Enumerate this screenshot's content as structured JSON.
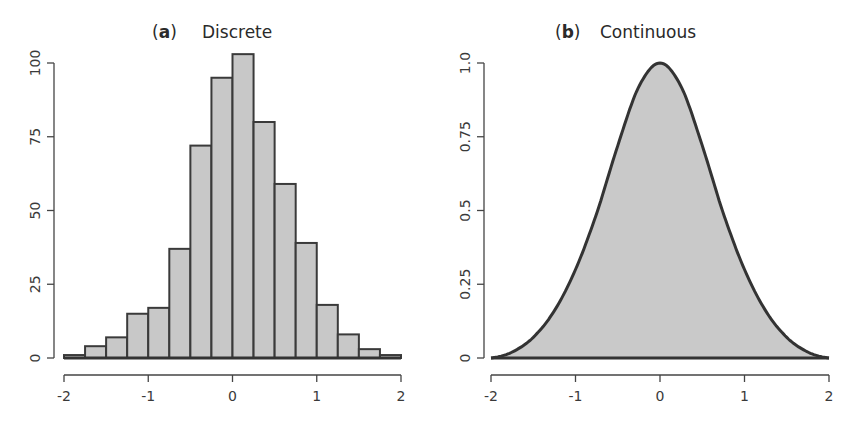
{
  "chart_data": [
    {
      "type": "bar",
      "panel_label": "a",
      "title": "Discrete",
      "xlabel": "",
      "ylabel": "",
      "bin_edges": [
        -2,
        -1.75,
        -1.5,
        -1.25,
        -1,
        -0.75,
        -0.5,
        -0.25,
        0,
        0.25,
        0.5,
        0.75,
        1,
        1.25,
        1.5,
        1.75,
        2
      ],
      "values": [
        1,
        4,
        7,
        15,
        17,
        37,
        72,
        95,
        103,
        80,
        59,
        39,
        18,
        8,
        3,
        1
      ],
      "xlim": [
        -2,
        2
      ],
      "ylim": [
        0,
        100
      ],
      "xticks": [
        -2,
        -1,
        0,
        1,
        2
      ],
      "xtick_labels": [
        "-2",
        "-1",
        "0",
        "1",
        "2"
      ],
      "yticks": [
        0,
        25,
        50,
        75,
        100
      ],
      "ytick_labels": [
        "0",
        "25",
        "50",
        "75",
        "100"
      ],
      "grid": false,
      "fill_color": "#c8c8c8",
      "edge_color": "#3a3a3a"
    },
    {
      "type": "area",
      "panel_label": "b",
      "title": "Continuous",
      "xlabel": "",
      "ylabel": "",
      "function": "normalized density, peak 1.0 at x=0",
      "x": [
        -2,
        -1.75,
        -1.5,
        -1.25,
        -1,
        -0.75,
        -0.5,
        -0.25,
        0,
        0.25,
        0.5,
        0.75,
        1,
        1.25,
        1.5,
        1.75,
        2
      ],
      "y": [
        0.0,
        0.02,
        0.07,
        0.16,
        0.3,
        0.49,
        0.72,
        0.92,
        1.0,
        0.92,
        0.72,
        0.49,
        0.3,
        0.16,
        0.07,
        0.02,
        0.0
      ],
      "xlim": [
        -2,
        2
      ],
      "ylim": [
        0,
        1.0
      ],
      "xticks": [
        -2,
        -1,
        0,
        1,
        2
      ],
      "xtick_labels": [
        "-2",
        "-1",
        "0",
        "1",
        "2"
      ],
      "yticks": [
        0,
        0.25,
        0.5,
        0.75,
        1.0
      ],
      "ytick_labels": [
        "0",
        "0.25",
        "0.5",
        "0.75",
        "1.0"
      ],
      "grid": false,
      "fill_color": "#c9c9c9",
      "line_color": "#333333"
    }
  ]
}
